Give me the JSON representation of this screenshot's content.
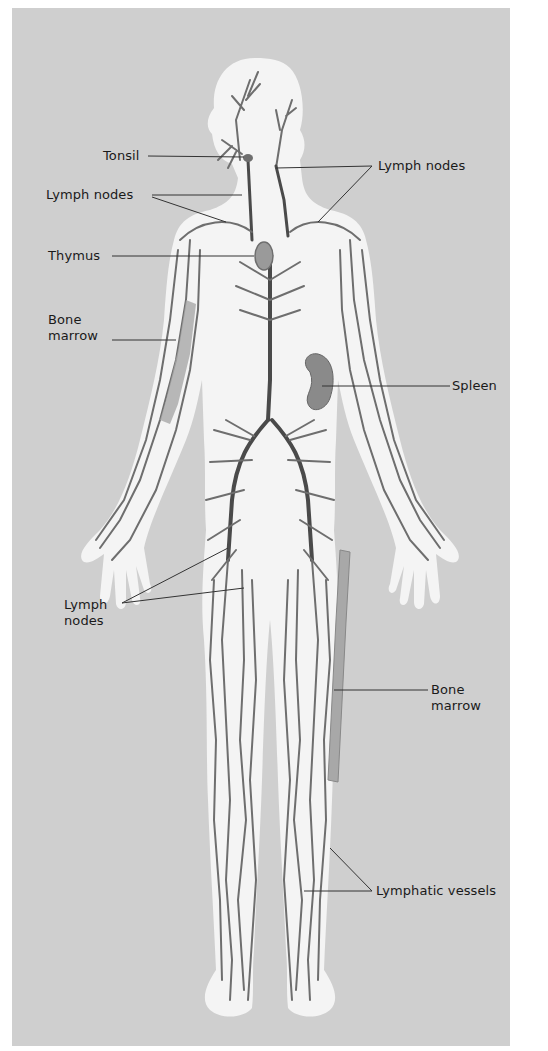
{
  "diagram": {
    "title": "",
    "colors": {
      "background_panel": "#cfcfcf",
      "body_silhouette": "#f4f4f4",
      "vessels": "#6e6e6e",
      "vessels_dark": "#4a4a4a",
      "organs": "#8a8a8a",
      "leader_lines": "#333333",
      "label_text": "#1a1a1a"
    },
    "labels": {
      "tonsil": "Tonsil",
      "lymph_nodes_neck_left": "Lymph nodes",
      "lymph_nodes_neck_right": "Lymph nodes",
      "thymus": "Thymus",
      "bone_marrow_arm": "Bone\nmarrow",
      "spleen": "Spleen",
      "lymph_nodes_groin": "Lymph\nnodes",
      "bone_marrow_femur": "Bone\nmarrow",
      "lymphatic_vessels": "Lymphatic vessels"
    }
  }
}
